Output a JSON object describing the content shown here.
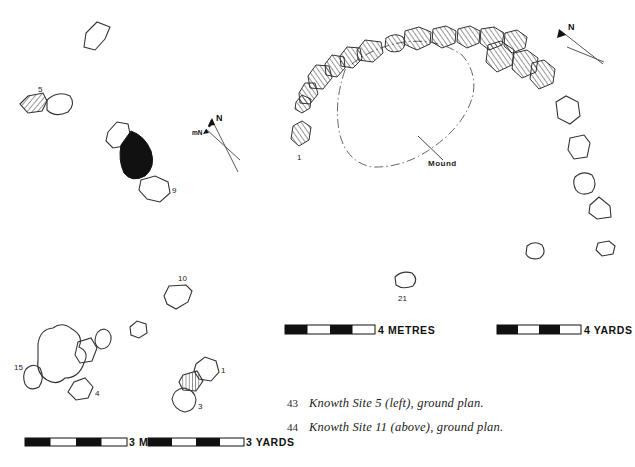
{
  "figure": {
    "ink_color": "#1a1a1a",
    "paper_color": "#ffffff"
  },
  "left_plan": {
    "name": "Knowth Site 5 ground plan",
    "north_arrow": {
      "true_north_label": "N",
      "magnetic_north_label": "mN"
    },
    "stone_labels": [
      "5",
      "9",
      "10",
      "15",
      "4",
      "1",
      "3"
    ],
    "scales": [
      {
        "value": "3",
        "unit": "METRES",
        "label": "3 METRES"
      },
      {
        "value": "3",
        "unit": "YARDS",
        "label": "3 YARDS"
      }
    ]
  },
  "right_plan": {
    "name": "Knowth Site 11 ground plan",
    "north_arrow": {
      "true_north_label": "N"
    },
    "stone_labels": [
      "1",
      "21"
    ],
    "annotations": [
      {
        "label": "Mound"
      }
    ],
    "kerb_stone_count": 15,
    "scales": [
      {
        "value": "4",
        "unit": "METRES",
        "label": "4 METRES"
      },
      {
        "value": "4",
        "unit": "YARDS",
        "label": "4 YARDS"
      }
    ]
  },
  "captions": [
    {
      "number": "43",
      "text": "Knowth Site 5 (left), ground plan."
    },
    {
      "number": "44",
      "text": "Knowth Site 11 (above), ground plan."
    }
  ]
}
